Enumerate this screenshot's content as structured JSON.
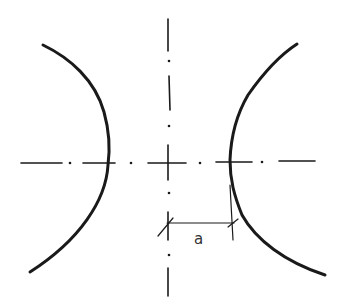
{
  "diagram": {
    "type": "hyperbola-sketch",
    "dimension_label": "a",
    "line_color": "#1a1a1a",
    "label_color": "#333333"
  }
}
